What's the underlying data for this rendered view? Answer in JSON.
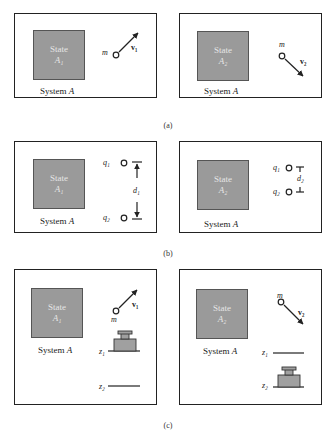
{
  "figure": {
    "panels": [
      {
        "id": "a",
        "caption": "(a)",
        "left": {
          "state_title": "State",
          "state_sub": "A₁",
          "system_label": "System",
          "system_var": "A",
          "mass_label": "m",
          "velocity_label": "v₁"
        },
        "right": {
          "state_title": "State",
          "state_sub": "A₂",
          "system_label": "System",
          "system_var": "A",
          "mass_label": "m",
          "velocity_label": "v₂"
        }
      },
      {
        "id": "b",
        "caption": "(b)",
        "left": {
          "state_title": "State",
          "state_sub": "A₁",
          "system_label": "System",
          "system_var": "A",
          "charge1_label": "q₁",
          "charge2_label": "q₂",
          "distance_label": "d₁"
        },
        "right": {
          "state_title": "State",
          "state_sub": "A₂",
          "system_label": "System",
          "system_var": "A",
          "charge1_label": "q₁",
          "charge2_label": "q₂",
          "distance_label": "d₂"
        }
      },
      {
        "id": "c",
        "caption": "(c)",
        "left": {
          "state_title": "State",
          "state_sub": "A₁",
          "system_label": "System",
          "system_var": "A",
          "mass_label": "m",
          "velocity_label": "v₁",
          "weight_label": "M",
          "z1_label": "z₁",
          "z2_label": "z₂"
        },
        "right": {
          "state_title": "State",
          "state_sub": "A₂",
          "system_label": "System",
          "system_var": "A",
          "mass_label": "m",
          "velocity_label": "v₂",
          "weight_label": "M",
          "z1_label": "z₁",
          "z2_label": "z₂"
        }
      }
    ],
    "colors": {
      "state_fill": "#9a9a9a",
      "state_text": "#e6e6e6",
      "line": "#222222",
      "weight_fill": "#a0a0a0"
    }
  }
}
